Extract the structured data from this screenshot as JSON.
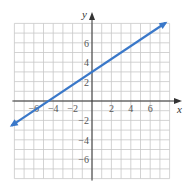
{
  "chart_data": {
    "type": "line",
    "title": "",
    "xlabel": "x",
    "ylabel": "y",
    "xlim": [
      -8,
      8
    ],
    "ylim": [
      -8,
      8
    ],
    "grid": true,
    "grid_step": 1,
    "x_ticks": [
      -6,
      -4,
      -2,
      2,
      4,
      6
    ],
    "y_ticks": [
      -6,
      -4,
      -2,
      2,
      4,
      6
    ],
    "x_tick_labels": [
      "−6",
      "−4",
      "−2",
      "2",
      "4",
      "6"
    ],
    "y_tick_labels": [
      "−6",
      "−4",
      "−2",
      "2",
      "4",
      "6"
    ],
    "series": [
      {
        "name": "line",
        "equation": "y = (2/3)x + 3",
        "slope": 0.6667,
        "intercept": 3,
        "x": [
          -8,
          -6,
          -4.5,
          0,
          3,
          6,
          7.5
        ],
        "y": [
          -2.33,
          -1,
          0,
          3,
          5,
          7,
          8
        ],
        "arrows_both_ends": true,
        "color": "#3a78c9"
      }
    ]
  },
  "colors": {
    "grid": "#c8c8c8",
    "axis": "#333333",
    "line": "#3a78c9"
  }
}
